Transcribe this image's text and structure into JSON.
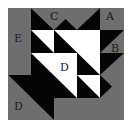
{
  "diagram": {
    "title": "",
    "colors": {
      "background": "#ffffff",
      "gray": "#6e6e6e",
      "black": "#050505",
      "white": "#ffffff",
      "label": "#1a1a1a"
    },
    "labels": {
      "a": "A",
      "b": "B",
      "c": "C",
      "d_center": "D",
      "d_corner": "D",
      "e": "E"
    }
  }
}
